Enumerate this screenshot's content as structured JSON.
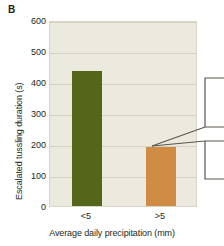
{
  "panel": {
    "label": "B"
  },
  "chart_data": {
    "type": "bar",
    "title": "",
    "subtitle": "",
    "categories": [
      "<5",
      ">5"
    ],
    "values": [
      435,
      190
    ],
    "series": [
      {
        "name": "Escalated tussling duration",
        "values": [
          435,
          190
        ],
        "colors": [
          "#536619",
          "#d08c44"
        ]
      }
    ],
    "xlabel": "Average daily precipitation (mm)",
    "ylabel": "Escalated tussling duration (s)",
    "ylim": [
      0,
      600
    ],
    "yticks": [
      0,
      100,
      200,
      300,
      400,
      500,
      600
    ],
    "ytick_labels": [
      "0",
      "100",
      "200",
      "300",
      "400",
      "500",
      "600"
    ],
    "grid": true,
    "legend": false,
    "legend_position": "none",
    "plot_background": "#eceade",
    "gridline_color": "#d5d2c2",
    "annotations": [
      {
        "name": "magnifier-callout",
        "text": "",
        "description": "bracket leader lines pointing from top of >5 bar to right edge"
      }
    ]
  },
  "colors": {
    "bar_green": "#536619",
    "bar_orange": "#d08c44",
    "plot_bg": "#eceade",
    "grid": "#d5d2c2",
    "text": "#231f20",
    "callout_line": "#5a554c"
  }
}
